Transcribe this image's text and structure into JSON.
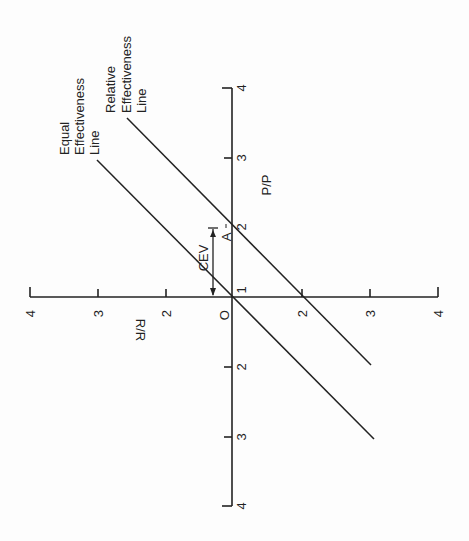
{
  "diagram": {
    "orientation": "rotated 90 degrees counter-clockwise",
    "colors": {
      "background": "#fdfdfd",
      "ink": "#222222"
    },
    "axes": {
      "vertical_axis": {
        "label": "P/P",
        "ticks_upper": [
          "4",
          "3",
          "2",
          "1"
        ],
        "ticks_lower": [
          "2",
          "3",
          "4"
        ]
      },
      "horizontal_axis": {
        "label": "R/R",
        "ticks_left": [
          "4",
          "3",
          "2"
        ],
        "ticks_right": [
          "2",
          "3",
          "4"
        ],
        "origin_label": "O"
      }
    },
    "lines": [
      {
        "name": "Equal Effectiveness Line",
        "label_lines": [
          "Equal",
          "Effectiveness",
          "Line"
        ]
      },
      {
        "name": "Relative Effectiveness Line",
        "label_lines": [
          "Relative",
          "Effectiveness",
          "Line"
        ]
      }
    ],
    "annotations": {
      "cev": "CEV",
      "a": "A"
    }
  }
}
